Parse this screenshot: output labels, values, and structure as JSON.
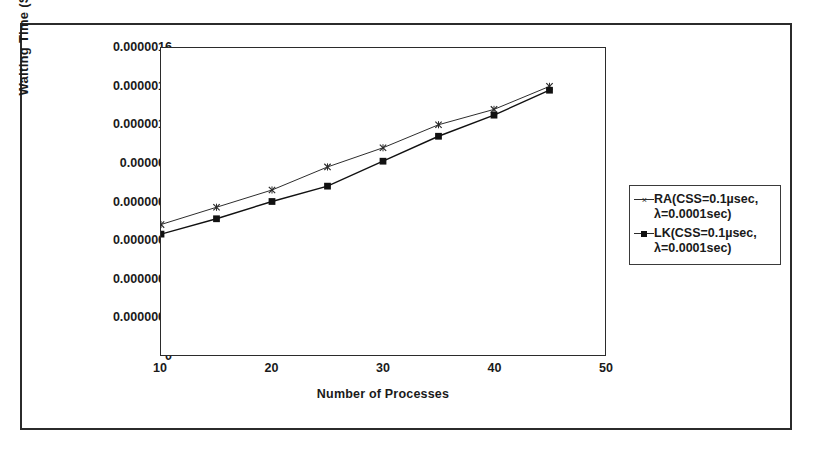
{
  "chart_data": {
    "type": "line",
    "title": "",
    "xlabel": "Number of Processes",
    "ylabel": "Waiting Time (Sec)",
    "x": [
      10,
      15,
      20,
      25,
      30,
      35,
      40,
      45
    ],
    "xlim": [
      10,
      50
    ],
    "ylim": [
      0,
      1.6e-06
    ],
    "xticks": [
      "10",
      "20",
      "30",
      "40",
      "50"
    ],
    "xtick_values": [
      10,
      20,
      30,
      40,
      50
    ],
    "yticks": [
      "0",
      "0.0000002",
      "0.0000004",
      "0.0000006",
      "0.0000008",
      "0.000001",
      "0.0000012",
      "0.0000014",
      "0.0000016"
    ],
    "ytick_values": [
      0,
      2e-07,
      4e-07,
      6e-07,
      8e-07,
      1e-06,
      1.2e-06,
      1.4e-06,
      1.6e-06
    ],
    "grid": false,
    "legend_position": "right",
    "series": [
      {
        "name": "RA(CSS=0.1µsec,\nλ=0.0001sec)",
        "marker": "cross",
        "color": "#2b2b2b",
        "values": [
          6.8e-07,
          7.7e-07,
          8.6e-07,
          9.8e-07,
          1.08e-06,
          1.2e-06,
          1.28e-06,
          1.4e-06
        ]
      },
      {
        "name": "LK(CSS=0.1µsec,\nλ=0.0001sec)",
        "marker": "square",
        "color": "#111111",
        "values": [
          6.3e-07,
          7.1e-07,
          8e-07,
          8.8e-07,
          1.01e-06,
          1.14e-06,
          1.25e-06,
          1.38e-06
        ]
      }
    ]
  },
  "legend": {
    "items": [
      {
        "label": "RA(CSS=0.1µsec,\nλ=0.0001sec)",
        "marker": "cross"
      },
      {
        "label": "LK(CSS=0.1µsec,\nλ=0.0001sec)",
        "marker": "square"
      }
    ]
  }
}
